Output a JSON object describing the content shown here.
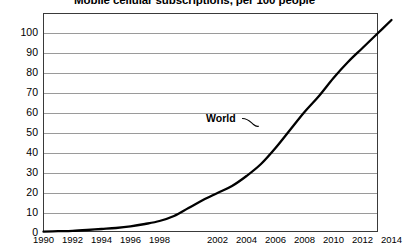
{
  "chart_data": {
    "type": "line",
    "title": "Mobile cellular subscriptions, per 100 people",
    "xlabel": "",
    "ylabel": "",
    "grid": true,
    "legend_position": "inline-annotation",
    "xlim": [
      1990,
      2014
    ],
    "ylim": [
      0,
      110
    ],
    "ytick_labels": [
      "0",
      "10",
      "20",
      "30",
      "40",
      "50",
      "60",
      "70",
      "80",
      "90",
      "100"
    ],
    "ytick_values": [
      0,
      10,
      20,
      30,
      40,
      50,
      60,
      70,
      80,
      90,
      100
    ],
    "xtick_labels": [
      "1990",
      "1992",
      "1994",
      "1996",
      "1998",
      "2002",
      "2004",
      "2006",
      "2008",
      "2010",
      "2012",
      "2014"
    ],
    "xtick_values": [
      1990,
      1992,
      1994,
      1996,
      1998,
      2000,
      2002,
      2004,
      2006,
      2008,
      2010,
      2012,
      2014
    ],
    "annotations": [
      {
        "text": "World",
        "x": 2005,
        "y": 52
      }
    ],
    "series": [
      {
        "name": "World",
        "color": "#000000",
        "x": [
          1990,
          1991,
          1992,
          1993,
          1994,
          1995,
          1996,
          1997,
          1998,
          1999,
          2000,
          2001,
          2002,
          2003,
          2004,
          2005,
          2006,
          2007,
          2008,
          2009,
          2010,
          2011,
          2012,
          2013,
          2014
        ],
        "values": [
          0.2,
          0.4,
          0.6,
          1.0,
          1.5,
          2.0,
          2.8,
          4.0,
          5.5,
          8.0,
          12.0,
          16.0,
          19.5,
          23.0,
          28.0,
          34.0,
          42.0,
          51.0,
          60.0,
          68.0,
          77.0,
          85.0,
          92.0,
          99.0,
          106.0
        ]
      }
    ]
  },
  "axes": {
    "y_axis_name": "subscriptions-per-100-people",
    "x_axis_name": "year"
  }
}
